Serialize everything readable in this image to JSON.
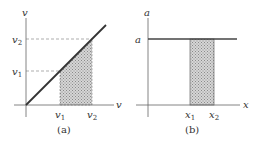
{
  "panels": [
    {
      "id": "a",
      "caption": "(a)",
      "y_axis_label": "v",
      "x_axis_label": "v",
      "y_ticks": [
        {
          "base": "v",
          "sub": "2"
        },
        {
          "base": "v",
          "sub": "1"
        }
      ],
      "x_ticks": [
        {
          "base": "v",
          "sub": "1"
        },
        {
          "base": "v",
          "sub": "2"
        }
      ],
      "curve": "line through origin, slope 1",
      "shaded_region": "trapezoid under line between v1 and v2"
    },
    {
      "id": "b",
      "caption": "(b)",
      "y_axis_label": "a",
      "x_axis_label": "x",
      "y_ticks": [
        {
          "base": "a",
          "sub": ""
        }
      ],
      "x_ticks": [
        {
          "base": "x",
          "sub": "1"
        },
        {
          "base": "x",
          "sub": "2"
        }
      ],
      "curve": "horizontal line at constant a",
      "shaded_region": "rectangle under line between x1 and x2"
    }
  ],
  "colors": {
    "axis": "#555555",
    "curve": "#333333",
    "dash": "#777777",
    "shade": "#b8b8b8"
  }
}
